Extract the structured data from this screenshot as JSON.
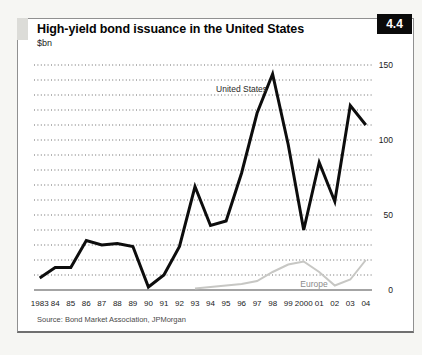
{
  "panel": {
    "figure_number": "4.4"
  },
  "chart_data": {
    "type": "line",
    "title": "High-yield bond issuance in the United States",
    "unit_label": "$bn",
    "source": "Source: Bond Market Association, JPMorgan",
    "x_labels": [
      "1983",
      "84",
      "85",
      "86",
      "87",
      "88",
      "89",
      "90",
      "91",
      "92",
      "93",
      "94",
      "95",
      "96",
      "97",
      "98",
      "99",
      "2000",
      "01",
      "02",
      "03",
      "04"
    ],
    "ylim": [
      0,
      150
    ],
    "y_ticks": [
      0,
      50,
      100,
      150
    ],
    "gridline_step": 10,
    "grid": "dotted-horizontal",
    "legend_position": "inline-labels",
    "series": [
      {
        "name": "United States",
        "color": "#0d0d0d",
        "width": 3,
        "values": [
          8,
          15,
          15,
          33,
          30,
          31,
          29,
          2,
          10,
          29,
          69,
          43,
          46,
          78,
          118,
          144,
          97,
          40,
          85,
          59,
          123,
          110
        ]
      },
      {
        "name": "Europe",
        "color": "#c7c7c4",
        "width": 2,
        "values": [
          null,
          null,
          null,
          null,
          null,
          null,
          null,
          null,
          null,
          null,
          1,
          2,
          3,
          4,
          6,
          12,
          17,
          19,
          12,
          3,
          7,
          20
        ]
      }
    ],
    "annotations": [
      {
        "text": "United States",
        "x_index": 13.0,
        "y_value": 132,
        "color": "#2a2a2a"
      },
      {
        "text": "Europe",
        "x_index": 17.66,
        "y_value": 2,
        "color": "#8b8b8b"
      }
    ]
  }
}
